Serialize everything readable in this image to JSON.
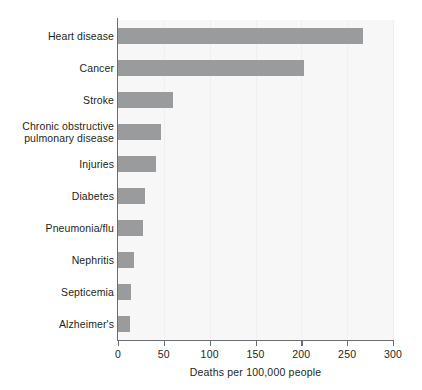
{
  "chart_data": {
    "type": "bar",
    "orientation": "horizontal",
    "title": "",
    "xlabel": "Deaths per 100,000 people",
    "ylabel": "",
    "categories": [
      "Heart disease",
      "Cancer",
      "Stroke",
      "Chronic obstructive pulmonary disease",
      "Injuries",
      "Diabetes",
      "Pneumonia/flu",
      "Nephritis",
      "Septicemia",
      "Alzheimer's"
    ],
    "category_label_lines": [
      [
        "Heart disease"
      ],
      [
        "Cancer"
      ],
      [
        "Stroke"
      ],
      [
        "Chronic obstructive",
        "pulmonary disease"
      ],
      [
        "Injuries"
      ],
      [
        "Diabetes"
      ],
      [
        "Pneumonia/flu"
      ],
      [
        "Nephritis"
      ],
      [
        "Septicemia"
      ],
      [
        "Alzheimer's"
      ]
    ],
    "values": [
      267,
      203,
      60,
      47,
      41,
      29,
      27,
      17,
      14,
      13
    ],
    "xlim": [
      0,
      300
    ],
    "xticks": [
      0,
      50,
      100,
      150,
      200,
      250,
      300
    ],
    "xtick_labels": [
      "0",
      "50",
      "100",
      "150",
      "200",
      "250",
      "300"
    ],
    "grid": true,
    "legend": false,
    "bar_color": "#9a9b9d",
    "plot_background": "#f7f7f7",
    "axis_color": "#6d6e71",
    "text_color": "#231f20"
  }
}
